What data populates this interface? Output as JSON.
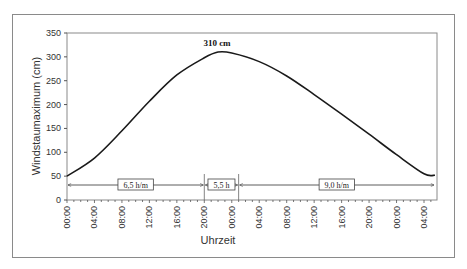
{
  "chart_data": {
    "type": "line",
    "title": "",
    "xlabel": "Uhrzeit",
    "ylabel": "Windstaumaximum (cm)",
    "ylim": [
      0,
      350
    ],
    "yticks": [
      0,
      50,
      100,
      150,
      200,
      250,
      300,
      350
    ],
    "xtick_labels": [
      "00:00",
      "04:00",
      "08:00",
      "12:00",
      "16:00",
      "20:00",
      "00:00",
      "04:00",
      "08:00",
      "12:00",
      "16:00",
      "20:00",
      "00:00",
      "04:00"
    ],
    "x_unit": "hours from start",
    "grid": false,
    "legend": null,
    "series": [
      {
        "name": "Windstau",
        "x": [
          0,
          4,
          8,
          12,
          16,
          20,
          22,
          24,
          28,
          32,
          36,
          40,
          44,
          48,
          52,
          53.6
        ],
        "values": [
          50,
          88,
          145,
          207,
          262,
          298,
          310,
          308,
          290,
          260,
          221,
          180,
          138,
          95,
          55,
          52
        ]
      }
    ],
    "annotations": [
      {
        "text": "310 cm",
        "x": 22,
        "y": 310,
        "type": "peak-label"
      },
      {
        "text": "6,5 h/m",
        "type": "interval",
        "from": 0,
        "to": 20,
        "y": 30
      },
      {
        "text": "5,5 h",
        "type": "interval",
        "from": 20,
        "to": 25,
        "y": 30
      },
      {
        "text": "9,0 h/m",
        "type": "interval",
        "from": 25,
        "to": 53.6,
        "y": 30
      }
    ]
  },
  "labels": {
    "peak": "310 cm",
    "interval1": "6,5 h/m",
    "interval2": "5,5 h",
    "interval3": "9,0 h/m",
    "xlabel": "Uhrzeit",
    "ylabel": "Windstaumaximum (cm)",
    "yticks": [
      "0",
      "50",
      "100",
      "150",
      "200",
      "250",
      "300",
      "350"
    ],
    "xticks": [
      "00:00",
      "04:00",
      "08:00",
      "12:00",
      "16:00",
      "20:00",
      "00:00",
      "04:00",
      "08:00",
      "12:00",
      "16:00",
      "20:00",
      "00:00",
      "04:00"
    ]
  }
}
